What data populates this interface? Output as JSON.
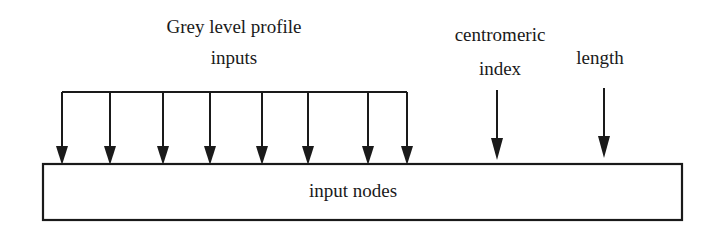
{
  "labels": {
    "grey_level_line1": "Grey level profile",
    "grey_level_line2": "inputs",
    "centromeric_line1": "centromeric",
    "centromeric_line2": "index",
    "length": "length",
    "box": "input nodes"
  },
  "diagram": {
    "stroke_color": "#1a1a1a",
    "grey_level_arrow_x": [
      62,
      110,
      163,
      210,
      262,
      308,
      368,
      407
    ],
    "bracket_y": 92,
    "box": {
      "x": 43,
      "y": 164,
      "width": 639,
      "height": 56
    }
  }
}
